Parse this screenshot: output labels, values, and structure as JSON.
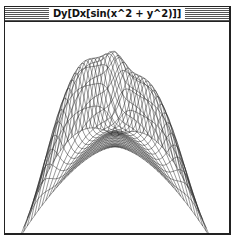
{
  "window": {
    "title": "Dy[Dx[sin(x^2 + y^2)]]"
  },
  "plot": {
    "type": "3d-wireframe-surface",
    "function": "D[y] D[x] sin(x^2 + y^2)",
    "line_color": "#1a1a1a",
    "background": "#ffffff",
    "grid_lines": 26
  }
}
